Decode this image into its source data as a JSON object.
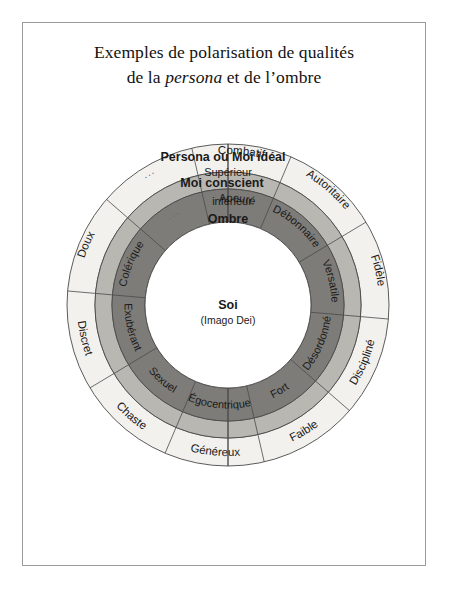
{
  "document": {
    "title_line1": "Exemples de polarisation de qualités",
    "title_line2_pre": "de la ",
    "title_line2_em": "persona",
    "title_line2_post": " et de l’ombre"
  },
  "chart_data": {
    "type": "pie",
    "title": "Exemples de polarisation de qualités de la persona et de l’ombre",
    "center": {
      "label": "Soi",
      "sublabel": "(Imago Dei)"
    },
    "rings": [
      {
        "name": "outer",
        "heading": "Persona ou Moi idéal",
        "subheading": "Supérieur",
        "fill": "#f2f1ee",
        "segments": [
          "Combatif",
          "Autoritaire",
          "Fidèle",
          "Discipliné",
          "Faible",
          "Généreux",
          "Chaste",
          "Discret",
          "Doux",
          "..."
        ]
      },
      {
        "name": "middle",
        "heading": "Moi conscient",
        "fill": "#b9b7b2",
        "segments": []
      },
      {
        "name": "inner",
        "heading": "Ombre",
        "subheading": "inférieur",
        "fill": "#7e7c78",
        "segments": [
          "Apeuré",
          "Débonnaire",
          "Versatile",
          "Désordonné",
          "Fort",
          "Égocentrique",
          "Sexuel",
          "Exubérant",
          "Colérique",
          "..."
        ]
      }
    ],
    "colors": {
      "outer_fill": "#f2f1ee",
      "middle_fill": "#b9b7b2",
      "inner_fill": "#7e7c78",
      "core_fill": "#ffffff",
      "stroke": "#4a4a4a",
      "frame": "#9a9a9a"
    },
    "geometry": {
      "cx": 228,
      "cy": 305,
      "r_outer": 161,
      "r_mid_out": 133,
      "r_mid_in": 116,
      "r_core": 83
    }
  }
}
